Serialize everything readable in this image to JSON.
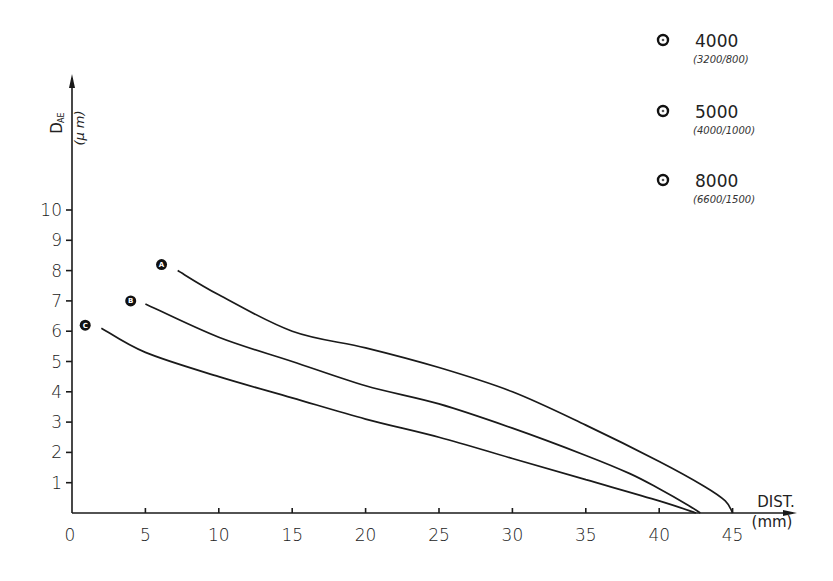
{
  "chart_data": {
    "type": "line",
    "title": "",
    "xlabel": "DIST. (mm)",
    "ylabel": "D_AE (μm)",
    "ylabel_main": "D",
    "ylabel_sub": "AE",
    "ylabel_unit": "(μ m)",
    "xlabel_main": "DIST.",
    "xlabel_unit": "(mm)",
    "xlim": [
      0,
      45
    ],
    "ylim": [
      0,
      10
    ],
    "x_ticks": [
      0,
      5,
      10,
      15,
      20,
      25,
      30,
      35,
      40,
      45
    ],
    "y_ticks": [
      1,
      2,
      3,
      4,
      5,
      6,
      7,
      8,
      9,
      10
    ],
    "grid": false,
    "legend_position": "top-right",
    "legend": [
      {
        "label": "4000",
        "sublabel": "(3200/800)"
      },
      {
        "label": "5000",
        "sublabel": "(4000/1000)"
      },
      {
        "label": "8000",
        "sublabel": "(6600/1500)"
      }
    ],
    "series": [
      {
        "name": "A",
        "marker_label": "A",
        "marker_point": [
          6.1,
          8.2
        ],
        "x": [
          7.2,
          10,
          15,
          20,
          25,
          30,
          35,
          40,
          43,
          44.5,
          45
        ],
        "y": [
          8.0,
          7.2,
          6.0,
          5.45,
          4.8,
          4.0,
          2.9,
          1.7,
          0.9,
          0.4,
          0.0
        ]
      },
      {
        "name": "B",
        "marker_label": "B",
        "marker_point": [
          4.0,
          7.0
        ],
        "x": [
          5.0,
          10,
          15,
          20,
          25,
          30,
          35,
          38,
          40,
          42,
          42.8
        ],
        "y": [
          6.9,
          5.8,
          5.0,
          4.2,
          3.6,
          2.8,
          1.9,
          1.3,
          0.8,
          0.25,
          0.0
        ]
      },
      {
        "name": "C",
        "marker_label": "C",
        "marker_point": [
          0.9,
          6.2
        ],
        "x": [
          2.0,
          5,
          10,
          15,
          20,
          25,
          30,
          35,
          40,
          42.5
        ],
        "y": [
          6.1,
          5.3,
          4.5,
          3.8,
          3.1,
          2.5,
          1.8,
          1.1,
          0.4,
          0.0
        ]
      }
    ]
  }
}
